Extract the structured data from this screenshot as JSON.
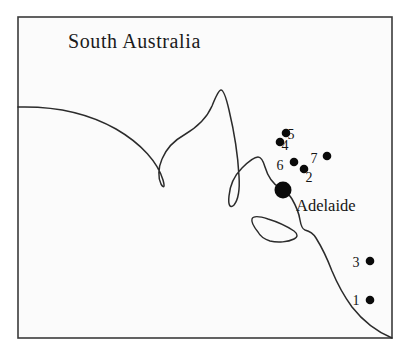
{
  "figure": {
    "width": 407,
    "height": 353,
    "background_color": "#ffffff",
    "frame_fill": "#fbfbfb",
    "frame_stroke": "#3b3b3b",
    "coastline_color": "#2b2b2b",
    "marker_color": "#0a0a0a",
    "text_color": "#141414"
  },
  "title": {
    "text": "South Australia",
    "x": 68,
    "y": 48,
    "font_size": 20
  },
  "city": {
    "name": "Adelaide",
    "label_x": 296,
    "label_y": 211,
    "dot_x": 283,
    "dot_y": 190,
    "dot_radius": 8.5
  },
  "sites": [
    {
      "label": "1",
      "dot_x": 370,
      "dot_y": 300,
      "dot_radius": 4.3,
      "label_x": 356,
      "label_y": 305
    },
    {
      "label": "2",
      "dot_x": 304,
      "dot_y": 169,
      "dot_radius": 4.3,
      "label_x": 309,
      "label_y": 182
    },
    {
      "label": "3",
      "dot_x": 370,
      "dot_y": 261,
      "dot_radius": 4.3,
      "label_x": 356,
      "label_y": 267
    },
    {
      "label": "4",
      "dot_x": 280,
      "dot_y": 142,
      "dot_radius": 4.3,
      "label_x": 285,
      "label_y": 150
    },
    {
      "label": "5",
      "dot_x": 286,
      "dot_y": 133,
      "dot_radius": 4.3,
      "label_x": 291,
      "label_y": 139
    },
    {
      "label": "6",
      "dot_x": 294,
      "dot_y": 162,
      "dot_radius": 4.3,
      "label_x": 280,
      "label_y": 170
    },
    {
      "label": "7",
      "dot_x": 327,
      "dot_y": 156,
      "dot_radius": 4.3,
      "label_x": 314,
      "label_y": 163
    }
  ],
  "geography": {
    "frame": {
      "x": 18,
      "y": 17,
      "width": 374,
      "height": 321
    },
    "coastline_path": "M 18 107 C 55 106 88 113 116 129 C 142 144 158 163 163 180 C 165 187 164 189 161 184 C 158 178 158 168 162 159 C 167 147 175 140 184 135 C 196 128 206 120 212 106 C 216 96 219 90 221 90 C 223 90 226 97 229 110 C 234 131 238 157 239 176 C 240 191 238 200 234 205 C 230 209 228 205 229 196 C 230 184 235 175 242 168 C 249 161 254 157 258 157 C 261 157 263 160 265 167 C 268 177 273 184 280 188 C 285 191 289 194 292 199 C 296 206 299 213 300 220 C 301 226 302 229 305 230 C 309 231 313 233 316 238 C 321 246 327 258 332 271 C 337 283 344 296 352 307 C 363 321 375 331 392 338",
    "island_path": "M 258 232 C 254 227 251 222 252 219 C 253 216 259 216 268 219 C 278 222 288 227 294 231 C 298 234 298 237 294 239 C 288 242 278 243 270 241 C 264 239 260 236 258 232 Z"
  }
}
